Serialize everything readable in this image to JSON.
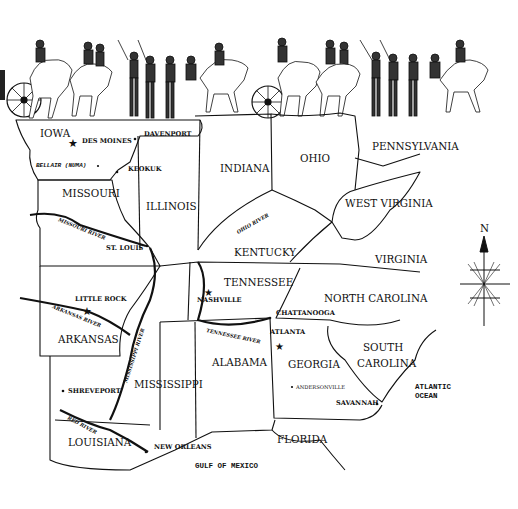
{
  "map": {
    "title_illustration": "Civil War cavalry and artillery procession",
    "states": [
      {
        "name": "IOWA",
        "x": 40,
        "y": 137
      },
      {
        "name": "MISSOURI",
        "x": 62,
        "y": 197
      },
      {
        "name": "ILLINOIS",
        "x": 146,
        "y": 210
      },
      {
        "name": "INDIANA",
        "x": 220,
        "y": 172
      },
      {
        "name": "OHIO",
        "x": 300,
        "y": 162
      },
      {
        "name": "PENNSYLVANIA",
        "x": 372,
        "y": 150
      },
      {
        "name": "WEST VIRGINIA",
        "x": 345,
        "y": 207
      },
      {
        "name": "KENTUCKY",
        "x": 234,
        "y": 256
      },
      {
        "name": "VIRGINIA",
        "x": 375,
        "y": 263
      },
      {
        "name": "TENNESSEE",
        "x": 224,
        "y": 286
      },
      {
        "name": "NORTH CAROLINA",
        "x": 324,
        "y": 302
      },
      {
        "name": "ARKANSAS",
        "x": 58,
        "y": 343
      },
      {
        "name": "MISSISSIPPI",
        "x": 134,
        "y": 388
      },
      {
        "name": "ALABAMA",
        "x": 212,
        "y": 366
      },
      {
        "name": "GEORGIA",
        "x": 288,
        "y": 368
      },
      {
        "name": "SOUTH",
        "x": 363,
        "y": 351
      },
      {
        "name": "CAROLINA",
        "x": 357,
        "y": 367
      },
      {
        "name": "LOUISIANA",
        "x": 68,
        "y": 446
      },
      {
        "name": "FLORIDA",
        "x": 277,
        "y": 443
      }
    ],
    "cities": [
      {
        "name": "DES MOINES",
        "x": 82,
        "y": 143,
        "marker": "star",
        "mx": 73,
        "my": 143
      },
      {
        "name": "DAVENPORT",
        "x": 144,
        "y": 136,
        "marker": "dot",
        "mx": 135,
        "my": 139
      },
      {
        "name": "KEOKUK",
        "x": 128,
        "y": 171,
        "marker": "dot",
        "mx": 117,
        "my": 172
      },
      {
        "name": "ST. LOUIS",
        "x": 106,
        "y": 250,
        "marker": "dot",
        "mx": 147,
        "my": 246
      },
      {
        "name": "LITTLE ROCK",
        "x": 75,
        "y": 301,
        "marker": "star",
        "mx": 87,
        "my": 311
      },
      {
        "name": "NASHVILLE",
        "x": 197,
        "y": 302,
        "marker": "star",
        "mx": 209,
        "my": 292
      },
      {
        "name": "CHATTANOOGA",
        "x": 276,
        "y": 315,
        "marker": "dot",
        "mx": 270,
        "my": 318
      },
      {
        "name": "ATLANTA",
        "x": 270,
        "y": 334,
        "marker": "star",
        "mx": 280,
        "my": 346
      },
      {
        "name": "SHREVEPORT",
        "x": 68,
        "y": 393,
        "marker": "dot",
        "mx": 63,
        "my": 391
      },
      {
        "name": "SAVANNAH",
        "x": 336,
        "y": 405,
        "marker": "dot",
        "mx": 377,
        "my": 404
      },
      {
        "name": "NEW ORLEANS",
        "x": 154,
        "y": 449,
        "marker": "dot",
        "mx": 146,
        "my": 452
      }
    ],
    "small_places": [
      {
        "name": "ANDERSONVILLE",
        "x": 296,
        "y": 389,
        "marker": "dot",
        "mx": 292,
        "my": 387
      },
      {
        "name": "BELLAIR (NUMA)",
        "x": 36,
        "y": 167,
        "marker": "dot",
        "mx": 98,
        "my": 166,
        "style": "mono"
      }
    ],
    "rivers": [
      {
        "name": "MISSOURI RIVER",
        "x": 58,
        "y": 221,
        "rotate": 22
      },
      {
        "name": "OHIO RIVER",
        "x": 238,
        "y": 234,
        "rotate": -30
      },
      {
        "name": "ARKANSAS RIVER",
        "x": 52,
        "y": 308,
        "rotate": 22
      },
      {
        "name": "MISSISSIPPI RIVER",
        "x": 127,
        "y": 383,
        "rotate": -72
      },
      {
        "name": "TENNESSEE RIVER",
        "x": 206,
        "y": 332,
        "rotate": 12
      },
      {
        "name": "RED RIVER",
        "x": 67,
        "y": 419,
        "rotate": 28
      }
    ],
    "water_bodies": [
      {
        "name": "ATLANTIC",
        "x": 415,
        "y": 389
      },
      {
        "name": "OCEAN",
        "x": 415,
        "y": 398
      },
      {
        "name": "GULF OF MEXICO",
        "x": 195,
        "y": 468
      }
    ],
    "compass": {
      "label": "N",
      "x": 484,
      "y": 248
    }
  }
}
